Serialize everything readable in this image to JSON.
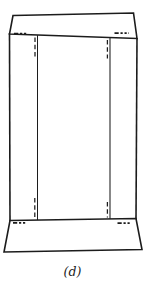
{
  "figure": {
    "caption": "(d)"
  },
  "colors": {
    "background": "#ffffff",
    "line": "#1c1c1c"
  }
}
